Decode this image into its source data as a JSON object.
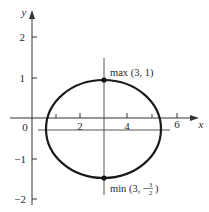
{
  "figure": {
    "type": "ellipse-graph",
    "axes": {
      "x_label": "x",
      "y_label": "y",
      "origin_label": "0",
      "x_ticks": [
        {
          "value": 1,
          "label": ""
        },
        {
          "value": 2,
          "label": "2"
        },
        {
          "value": 4,
          "label": "4"
        },
        {
          "value": 5,
          "label": ""
        },
        {
          "value": 6,
          "label": "6"
        }
      ],
      "y_ticks": [
        {
          "value": 2,
          "label": "2"
        },
        {
          "value": 1,
          "label": "1"
        },
        {
          "value": -1,
          "label": "−1"
        },
        {
          "value": -2,
          "label": "−2"
        }
      ]
    },
    "curve": {
      "shape": "ellipse",
      "center": [
        3,
        -0.25
      ],
      "x_range": [
        0.6,
        5.4
      ],
      "y_range": [
        -1.5,
        1
      ]
    },
    "points": [
      {
        "name": "max",
        "label": "max (3, 1)",
        "x": 3,
        "y": 1
      },
      {
        "name": "min",
        "label_prefix": "min (3, −",
        "label_num": "3",
        "label_den": "2",
        "label_suffix": ")",
        "x": 3,
        "y": -1.5
      }
    ],
    "colors": {
      "stroke": "#1a1a1a",
      "axis": "#333333"
    }
  }
}
